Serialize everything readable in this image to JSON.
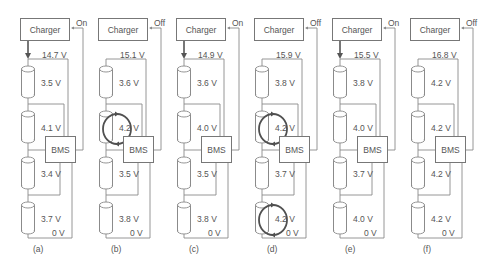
{
  "figure": {
    "colors": {
      "line": "#8a8a8a",
      "text": "#555555",
      "highlight": "#505050"
    },
    "labels": {
      "charger": "Charger",
      "bms": "BMS"
    },
    "panels": [
      {
        "id": "a",
        "caption": "(a)",
        "charger_state": "On",
        "charging": true,
        "pack_voltage": "14.7 V",
        "ground": "0 V",
        "cells": [
          "3.5 V",
          "4.1 V",
          "3.4 V",
          "3.7 V"
        ],
        "balancing": [
          false,
          false,
          false,
          false
        ]
      },
      {
        "id": "b",
        "caption": "(b)",
        "charger_state": "Off",
        "charging": false,
        "pack_voltage": "15.1 V",
        "ground": "0 V",
        "cells": [
          "3.6 V",
          "4.2 V",
          "3.5 V",
          "3.8 V"
        ],
        "balancing": [
          false,
          true,
          false,
          false
        ]
      },
      {
        "id": "c",
        "caption": "(c)",
        "charger_state": "On",
        "charging": true,
        "pack_voltage": "14.9 V",
        "ground": "0 V",
        "cells": [
          "3.6 V",
          "4.0 V",
          "3.5 V",
          "3.8 V"
        ],
        "balancing": [
          false,
          false,
          false,
          false
        ]
      },
      {
        "id": "d",
        "caption": "(d)",
        "charger_state": "Off",
        "charging": false,
        "pack_voltage": "15.9 V",
        "ground": "0 V",
        "cells": [
          "3.8 V",
          "4.2 V",
          "3.7 V",
          "4.2 V"
        ],
        "balancing": [
          false,
          true,
          false,
          true
        ]
      },
      {
        "id": "e",
        "caption": "(e)",
        "charger_state": "On",
        "charging": true,
        "pack_voltage": "15.5 V",
        "ground": "0 V",
        "cells": [
          "3.8 V",
          "4.0 V",
          "3.7 V",
          "4.0 V"
        ],
        "balancing": [
          false,
          false,
          false,
          false
        ]
      },
      {
        "id": "f",
        "caption": "(f)",
        "charger_state": "Off",
        "charging": false,
        "pack_voltage": "16.8 V",
        "ground": "0 V",
        "cells": [
          "4.2 V",
          "4.2 V",
          "4.2 V",
          "4.2 V"
        ],
        "balancing": [
          false,
          false,
          false,
          false
        ]
      }
    ]
  }
}
